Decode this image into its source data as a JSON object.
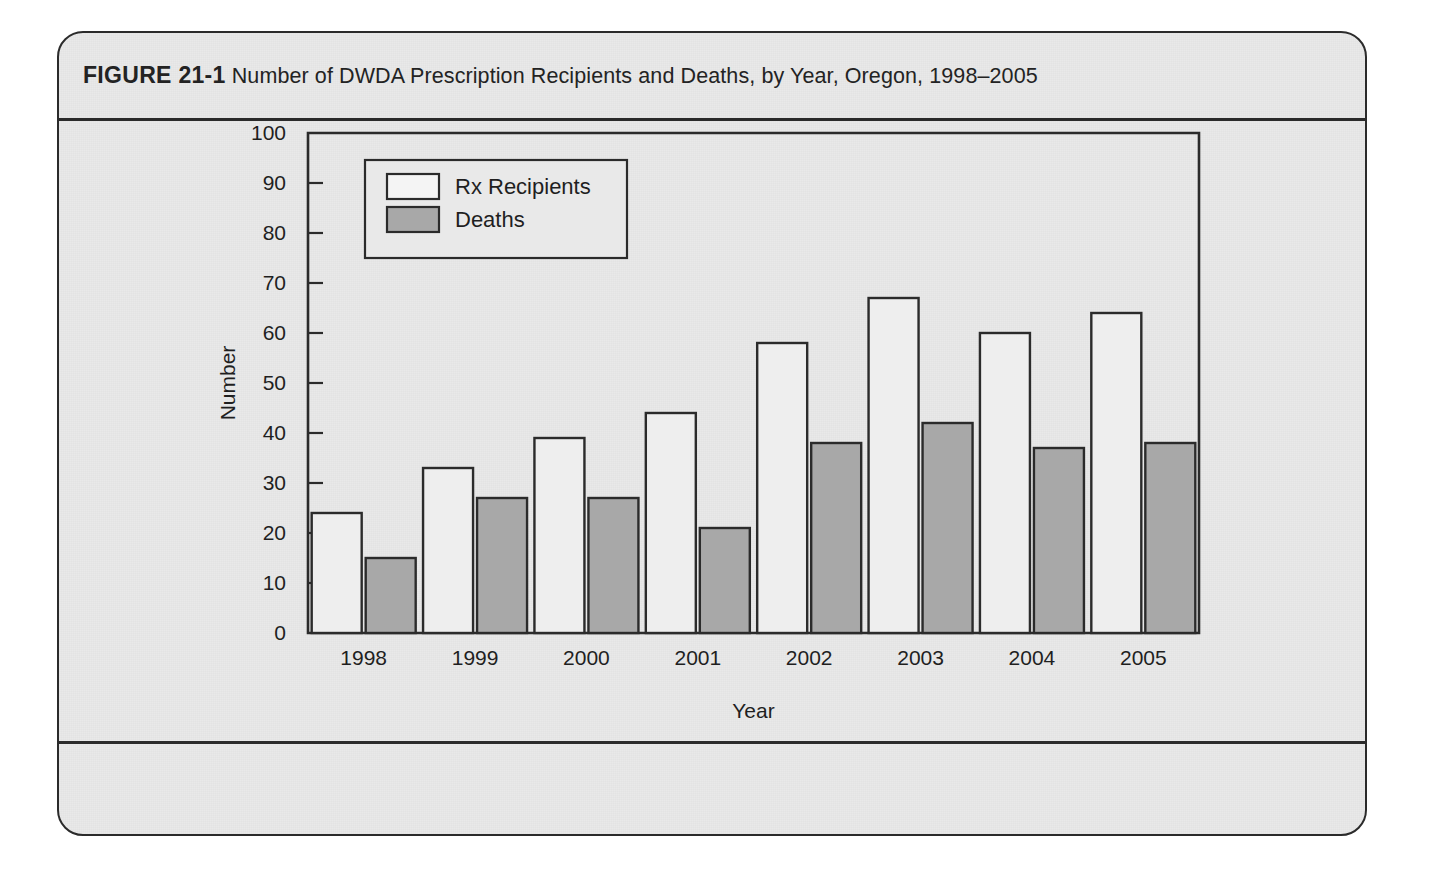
{
  "figure": {
    "label": "FIGURE 21-1",
    "caption": "Number of DWDA Prescription Recipients and Deaths, by Year, Oregon, 1998–2005"
  },
  "colors": {
    "page_background": "#ffffff",
    "figure_background": "#e9e9e9",
    "frame": "#2b2b2b",
    "bar_rx_fill": "#eeeeee",
    "bar_deaths_fill": "#a8a8a8",
    "text": "#1f1f1f"
  },
  "chart_data": {
    "type": "bar",
    "title": "Number of DWDA Prescription Recipients and Deaths, by Year, Oregon, 1998–2005",
    "subtitle": "",
    "xlabel": "Year",
    "ylabel": "Number",
    "categories": [
      "1998",
      "1999",
      "2000",
      "2001",
      "2002",
      "2003",
      "2004",
      "2005"
    ],
    "series": [
      {
        "name": "Rx Recipients",
        "values": [
          24,
          33,
          39,
          44,
          58,
          67,
          60,
          64
        ],
        "fill": "#eeeeee"
      },
      {
        "name": "Deaths",
        "values": [
          15,
          27,
          27,
          21,
          38,
          42,
          37,
          38
        ],
        "fill": "#a8a8a8"
      }
    ],
    "ylim": [
      0,
      100
    ],
    "yticks": [
      0,
      10,
      20,
      30,
      40,
      50,
      60,
      70,
      80,
      90,
      100
    ],
    "ytick_labels": [
      "0",
      "10",
      "20",
      "30",
      "40",
      "50",
      "60",
      "70",
      "80",
      "90",
      "100"
    ],
    "grid": false,
    "legend_position": "upper-left",
    "legend_entries": [
      "Rx Recipients",
      "Deaths"
    ]
  }
}
